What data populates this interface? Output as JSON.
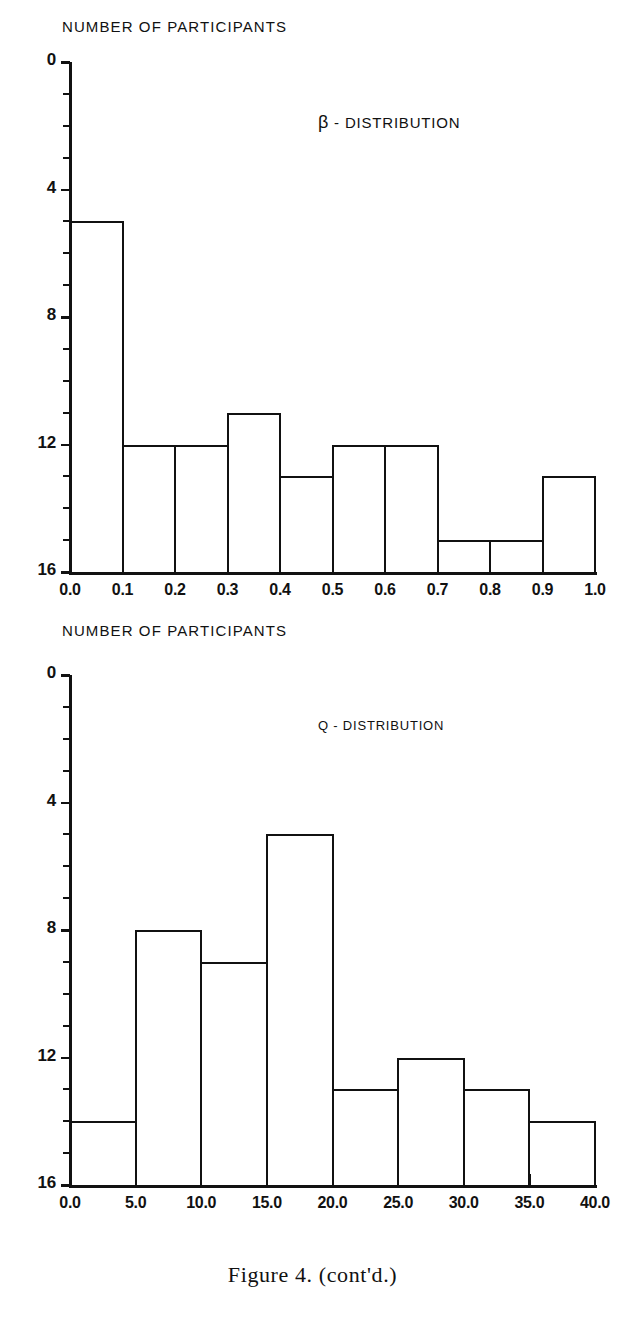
{
  "caption": "Figure 4. (cont'd.)",
  "charts": [
    {
      "id": "beta",
      "axis_title": "NUMBER OF PARTICIPANTS",
      "series_title_symbol": "β",
      "series_title_rest": " - DISTRIBUTION",
      "series_title_full": "β - DISTRIBUTION",
      "ylabels": [
        "16",
        "12",
        "8",
        "4",
        "0"
      ],
      "xlabels": [
        "0.0",
        "0.1",
        "0.2",
        "0.3",
        "0.4",
        "0.5",
        "0.6",
        "0.7",
        "0.8",
        "0.9",
        "1.0"
      ],
      "chart_data": {
        "type": "bar",
        "title": "β - DISTRIBUTION",
        "xlabel": "",
        "ylabel": "NUMBER OF PARTICIPANTS",
        "categories": [
          "0.0-0.1",
          "0.1-0.2",
          "0.2-0.3",
          "0.3-0.4",
          "0.4-0.5",
          "0.5-0.6",
          "0.6-0.7",
          "0.7-0.8",
          "0.8-0.9",
          "0.9-1.0"
        ],
        "bin_edges": [
          0.0,
          0.1,
          0.2,
          0.3,
          0.4,
          0.5,
          0.6,
          0.7,
          0.8,
          0.9,
          1.0
        ],
        "values": [
          11,
          4,
          4,
          5,
          3,
          4,
          4,
          1,
          1,
          3
        ],
        "xlim": [
          0.0,
          1.0
        ],
        "ylim": [
          0,
          16
        ],
        "ytick_major": [
          0,
          4,
          8,
          12,
          16
        ],
        "ytick_minor_step": 1,
        "grid": false,
        "legend": "none"
      }
    },
    {
      "id": "q",
      "axis_title": "NUMBER OF PARTICIPANTS",
      "series_title_symbol": "Q",
      "series_title_rest": " - DISTRIBUTION",
      "series_title_full": "Q - DISTRIBUTION",
      "ylabels": [
        "16",
        "12",
        "8",
        "4",
        "0"
      ],
      "xlabels": [
        "0.0",
        "5.0",
        "10.0",
        "15.0",
        "20.0",
        "25.0",
        "30.0",
        "35.0",
        "40.0"
      ],
      "chart_data": {
        "type": "bar",
        "title": "Q - DISTRIBUTION",
        "xlabel": "",
        "ylabel": "NUMBER OF PARTICIPANTS",
        "categories": [
          "0-5",
          "5-10",
          "10-15",
          "15-20",
          "20-25",
          "25-30",
          "30-35",
          "35-40"
        ],
        "bin_edges": [
          0,
          5,
          10,
          15,
          20,
          25,
          30,
          35,
          40
        ],
        "values": [
          2,
          8,
          7,
          11,
          3,
          4,
          3,
          2
        ],
        "xlim": [
          0,
          40
        ],
        "ylim": [
          0,
          16
        ],
        "ytick_major": [
          0,
          4,
          8,
          12,
          16
        ],
        "ytick_minor_step": 1,
        "grid": false,
        "legend": "none"
      }
    }
  ]
}
